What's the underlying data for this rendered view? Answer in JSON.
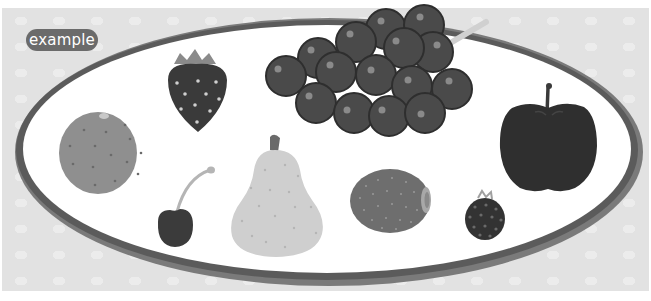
{
  "label": {
    "text": "example"
  },
  "scene": {
    "description": "Oval platter with fruits",
    "items": [
      {
        "name": "strawberry"
      },
      {
        "name": "grapes"
      },
      {
        "name": "orange"
      },
      {
        "name": "cherry"
      },
      {
        "name": "pear"
      },
      {
        "name": "kiwi"
      },
      {
        "name": "blackberry"
      },
      {
        "name": "apple"
      }
    ]
  },
  "colors": {
    "background": "#e2e2e2",
    "badge": "#6b6b6b",
    "plate_rim": "#5a5a5a",
    "plate": "#ffffff"
  }
}
